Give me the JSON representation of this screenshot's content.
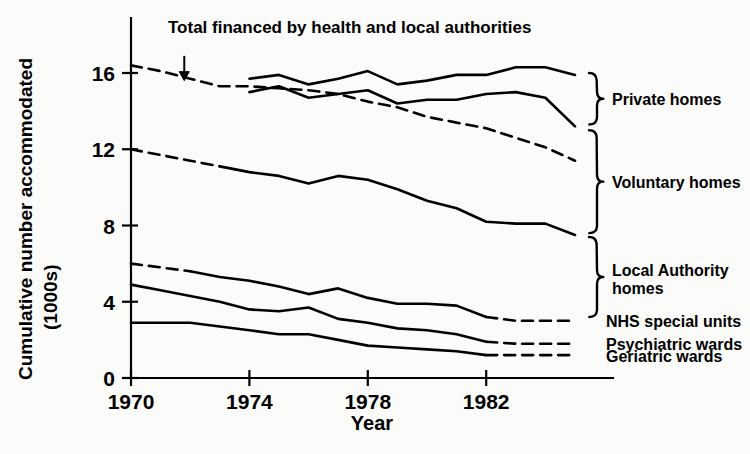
{
  "chart_data": {
    "type": "line",
    "title": "",
    "xlabel": "Year",
    "ylabel": "Cumulative number accommodated (1000s)",
    "ylabel_line1": "Cumulative number accommodated",
    "ylabel_line2": "(1000s)",
    "xlim": [
      1970,
      1985
    ],
    "ylim": [
      0,
      17.2
    ],
    "grid": false,
    "legend_position": "right",
    "xticks": [
      "1970",
      "1974",
      "1978",
      "1982"
    ],
    "xtick_values": [
      1970,
      1974,
      1978,
      1982
    ],
    "yticks": [
      "0",
      "4",
      "8",
      "12",
      "16"
    ],
    "ytick_values": [
      0,
      4,
      8,
      12,
      16
    ],
    "annotations": [
      {
        "name": "total-financed-annotation",
        "text": "Total financed by health and local authorities",
        "arrow_x": 1971.8,
        "arrow_y_top": 16.9,
        "arrow_y_tip": 15.6
      }
    ],
    "series": [
      {
        "name": "Total financed by health and local authorities",
        "style": "dashed",
        "x": [
          1970,
          1971,
          1972,
          1973,
          1974,
          1975,
          1976,
          1977,
          1978,
          1979,
          1980,
          1981,
          1982,
          1983,
          1984,
          1985
        ],
        "values": [
          16.4,
          16.1,
          15.7,
          15.3,
          15.3,
          15.2,
          15.1,
          14.9,
          14.5,
          14.2,
          13.7,
          13.4,
          13.1,
          12.6,
          12.1,
          11.4
        ]
      },
      {
        "name": "Private homes (upper cumulative)",
        "style": "solid",
        "x": [
          1974,
          1975,
          1976,
          1977,
          1978,
          1979,
          1980,
          1981,
          1982,
          1983,
          1984,
          1985
        ],
        "values": [
          15.7,
          15.9,
          15.4,
          15.7,
          16.1,
          15.4,
          15.6,
          15.9,
          15.9,
          16.3,
          16.3,
          15.9
        ]
      },
      {
        "name": "Private homes (lower boundary)",
        "style": "solid",
        "x": [
          1974,
          1975,
          1976,
          1977,
          1978,
          1979,
          1980,
          1981,
          1982,
          1983,
          1984,
          1985
        ],
        "values": [
          15.0,
          15.3,
          14.7,
          14.9,
          15.1,
          14.4,
          14.6,
          14.6,
          14.9,
          15.0,
          14.7,
          13.2
        ]
      },
      {
        "name": "Local Authority homes (cumulative)",
        "style": "mixed",
        "dash_until": 1973,
        "x": [
          1970,
          1971,
          1972,
          1973,
          1974,
          1975,
          1976,
          1977,
          1978,
          1979,
          1980,
          1981,
          1982,
          1983,
          1984,
          1985
        ],
        "values": [
          12.0,
          11.7,
          11.4,
          11.1,
          10.8,
          10.6,
          10.2,
          10.6,
          10.4,
          9.9,
          9.3,
          8.9,
          8.2,
          8.1,
          8.1,
          7.5
        ]
      },
      {
        "name": "NHS special units (cumulative)",
        "style": "mixed",
        "dash_until": 1972,
        "dash_from": 1982,
        "x": [
          1970,
          1971,
          1972,
          1973,
          1974,
          1975,
          1976,
          1977,
          1978,
          1979,
          1980,
          1981,
          1982,
          1983,
          1984,
          1985
        ],
        "values": [
          6.0,
          5.8,
          5.6,
          5.3,
          5.1,
          4.8,
          4.4,
          4.7,
          4.2,
          3.9,
          3.9,
          3.8,
          3.2,
          3.0,
          3.0,
          3.0
        ]
      },
      {
        "name": "Psychiatric wards (cumulative)",
        "style": "mixed",
        "dash_from": 1982,
        "x": [
          1970,
          1971,
          1972,
          1973,
          1974,
          1975,
          1976,
          1977,
          1978,
          1979,
          1980,
          1981,
          1982,
          1983,
          1984,
          1985
        ],
        "values": [
          4.9,
          4.6,
          4.3,
          4.0,
          3.6,
          3.5,
          3.7,
          3.1,
          2.9,
          2.6,
          2.5,
          2.3,
          1.9,
          1.8,
          1.8,
          1.8
        ]
      },
      {
        "name": "Geriatric wards (cumulative)",
        "style": "mixed",
        "dash_from": 1982,
        "x": [
          1970,
          1971,
          1972,
          1973,
          1974,
          1975,
          1976,
          1977,
          1978,
          1979,
          1980,
          1981,
          1982,
          1983,
          1984,
          1985
        ],
        "values": [
          2.9,
          2.9,
          2.9,
          2.7,
          2.5,
          2.3,
          2.3,
          2.0,
          1.7,
          1.6,
          1.5,
          1.4,
          1.2,
          1.2,
          1.2,
          1.2
        ]
      }
    ],
    "legend": [
      {
        "label": "Private homes",
        "brace": true,
        "y_top": 16.0,
        "y_bottom": 13.3
      },
      {
        "label": "Voluntary homes",
        "brace": true,
        "y_top": 13.0,
        "y_bottom": 7.6
      },
      {
        "label": "Local Authority homes",
        "brace": true,
        "y_top": 7.4,
        "y_bottom": 3.2,
        "line1": "Local Authority",
        "line2": "homes"
      },
      {
        "label": "NHS special units",
        "brace": false
      },
      {
        "label": "Psychiatric wards",
        "brace": false
      },
      {
        "label": "Geriatric wards",
        "brace": false
      }
    ]
  }
}
